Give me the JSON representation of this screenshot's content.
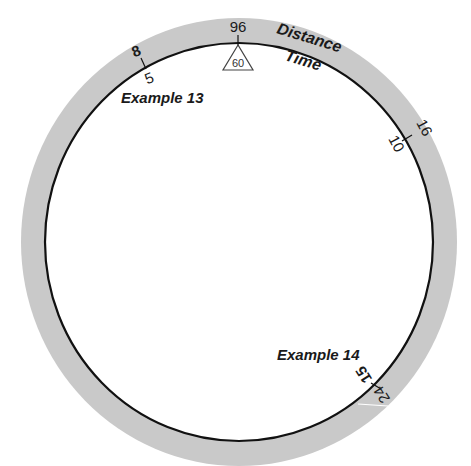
{
  "diagram": {
    "type": "circular-slide-rule",
    "colors": {
      "outer_ring": "#c8c8c8",
      "inner_line": "#111111",
      "background": "#ffffff",
      "text": "#1a1a1a"
    },
    "scales": {
      "outer_label": "Distance",
      "inner_label": "Time"
    },
    "index": {
      "outer_value": "96",
      "triangle_value": "60"
    },
    "settings": [
      {
        "name": "Example 13",
        "outer_value": "8",
        "inner_value": "5"
      },
      {
        "name": "",
        "outer_value": "16",
        "inner_value": "10"
      },
      {
        "name": "Example 14",
        "outer_value": "24",
        "inner_value": "15"
      }
    ]
  }
}
